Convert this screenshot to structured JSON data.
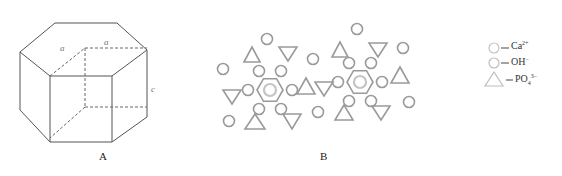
{
  "figure": {
    "panel_a": {
      "label": "A",
      "description": "hexagonal prism unit cell",
      "edge_labels": {
        "a1": "a",
        "a2": "a",
        "c": "c"
      }
    },
    "panel_b": {
      "label": "B",
      "description": "hydroxyapatite ion arrangement"
    },
    "legend": [
      {
        "shape": "circle",
        "ion": "Ca",
        "charge": "2+"
      },
      {
        "shape": "circle-light",
        "ion": "OH",
        "charge": "−"
      },
      {
        "shape": "triangle",
        "ion": "PO",
        "sub": "4",
        "charge": "3−"
      }
    ],
    "colors": {
      "line": "#555555",
      "shape": "#9a9a9a",
      "shape_light": "#c4c4c4"
    }
  }
}
